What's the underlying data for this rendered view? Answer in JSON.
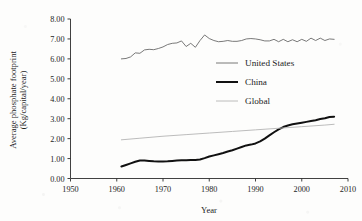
{
  "chart_data": {
    "type": "line",
    "title": "",
    "xlabel": "Year",
    "ylabel": "Average phosphate footprint (Kg/capital/year)",
    "ylabel_line1": "Average phosphate footprint",
    "ylabel_line2": "(Kg/capital/year)",
    "xlim": [
      1950,
      2010
    ],
    "ylim": [
      0.0,
      8.0
    ],
    "xticks": [
      1950,
      1960,
      1970,
      1980,
      1990,
      2000,
      2010
    ],
    "xtick_labels": [
      "1950",
      "1960",
      "1970",
      "1980",
      "1990",
      "2000",
      "2010"
    ],
    "yticks": [
      0.0,
      1.0,
      2.0,
      3.0,
      4.0,
      5.0,
      6.0,
      7.0,
      8.0
    ],
    "ytick_labels": [
      "0.00",
      "1.00",
      "2.00",
      "3.00",
      "4.00",
      "5.00",
      "6.00",
      "7.00",
      "8.00"
    ],
    "grid": false,
    "legend_position": "center-right",
    "series": [
      {
        "name": "United States",
        "color": "#6a6a6a",
        "width": 0.9,
        "x": [
          1961,
          1962,
          1963,
          1964,
          1965,
          1966,
          1967,
          1968,
          1969,
          1970,
          1971,
          1972,
          1973,
          1974,
          1975,
          1976,
          1977,
          1978,
          1979,
          1980,
          1981,
          1982,
          1983,
          1984,
          1985,
          1986,
          1987,
          1988,
          1989,
          1990,
          1991,
          1992,
          1993,
          1994,
          1995,
          1996,
          1997,
          1998,
          1999,
          2000,
          2001,
          2002,
          2003,
          2004,
          2005,
          2006,
          2007
        ],
        "values": [
          6.0,
          6.02,
          6.1,
          6.3,
          6.28,
          6.45,
          6.48,
          6.46,
          6.52,
          6.6,
          6.72,
          6.78,
          6.8,
          6.9,
          6.62,
          6.78,
          6.58,
          6.92,
          7.2,
          7.02,
          6.92,
          6.86,
          6.88,
          6.92,
          6.88,
          6.88,
          6.92,
          7.0,
          7.02,
          7.0,
          6.96,
          6.9,
          6.9,
          6.98,
          6.86,
          6.98,
          6.86,
          6.96,
          6.86,
          6.98,
          6.88,
          7.04,
          6.92,
          7.04,
          6.92,
          7.0,
          6.98
        ]
      },
      {
        "name": "China",
        "color": "#111111",
        "width": 2.0,
        "x": [
          1961,
          1962,
          1963,
          1964,
          1965,
          1966,
          1967,
          1968,
          1969,
          1970,
          1971,
          1972,
          1973,
          1974,
          1975,
          1976,
          1977,
          1978,
          1979,
          1980,
          1981,
          1982,
          1983,
          1984,
          1985,
          1986,
          1987,
          1988,
          1989,
          1990,
          1991,
          1992,
          1993,
          1994,
          1995,
          1996,
          1997,
          1998,
          1999,
          2000,
          2001,
          2002,
          2003,
          2004,
          2005,
          2006,
          2007
        ],
        "values": [
          0.6,
          0.68,
          0.76,
          0.84,
          0.9,
          0.9,
          0.88,
          0.86,
          0.85,
          0.85,
          0.86,
          0.88,
          0.9,
          0.91,
          0.92,
          0.93,
          0.93,
          0.95,
          1.02,
          1.1,
          1.16,
          1.22,
          1.28,
          1.35,
          1.42,
          1.5,
          1.58,
          1.66,
          1.7,
          1.76,
          1.86,
          2.0,
          2.16,
          2.32,
          2.46,
          2.58,
          2.66,
          2.72,
          2.76,
          2.8,
          2.84,
          2.88,
          2.92,
          2.98,
          3.02,
          3.08,
          3.1
        ]
      },
      {
        "name": "Global",
        "color": "#b4b4b4",
        "width": 0.9,
        "x": [
          1961,
          1965,
          1970,
          1975,
          1980,
          1985,
          1990,
          1995,
          2000,
          2005,
          2007
        ],
        "values": [
          1.94,
          2.02,
          2.12,
          2.2,
          2.28,
          2.36,
          2.44,
          2.52,
          2.6,
          2.68,
          2.72
        ]
      }
    ]
  },
  "legend": {
    "items": [
      {
        "label": "United States"
      },
      {
        "label": "China"
      },
      {
        "label": "Global"
      }
    ]
  }
}
